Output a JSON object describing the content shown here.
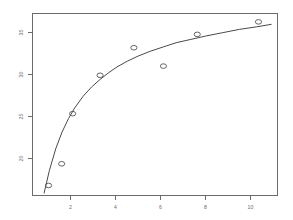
{
  "chart_data": {
    "type": "scatter",
    "title": "",
    "subtitle": "",
    "xlabel": "",
    "ylabel": "",
    "grid": false,
    "legend": "none",
    "xlim": [
      0.0,
      11.6
    ],
    "ylim": [
      15.6,
      37.4
    ],
    "xticks": [
      2,
      4,
      6,
      8,
      10
    ],
    "xticklabels": [
      "2",
      "4",
      "6",
      "8",
      "10"
    ],
    "yticks": [
      20,
      25,
      30,
      35
    ],
    "yticklabels": [
      "20",
      "25",
      "30",
      "35"
    ],
    "ytick_rotation": 90,
    "marker": "open-circle",
    "points": [
      {
        "x": 0.76,
        "y": 16.8
      },
      {
        "x": 1.38,
        "y": 19.4
      },
      {
        "x": 1.9,
        "y": 25.4
      },
      {
        "x": 3.2,
        "y": 30.0
      },
      {
        "x": 4.8,
        "y": 33.3
      },
      {
        "x": 6.2,
        "y": 31.1
      },
      {
        "x": 7.8,
        "y": 34.9
      },
      {
        "x": 10.7,
        "y": 36.4
      }
    ],
    "series": [
      {
        "name": "observed",
        "x": [
          0.76,
          1.38,
          1.9,
          3.2,
          4.8,
          6.2,
          7.8,
          10.7
        ],
        "values": [
          16.8,
          19.4,
          25.4,
          30.0,
          33.3,
          31.1,
          34.9,
          36.4
        ]
      },
      {
        "name": "fitted-curve",
        "type": "line",
        "x": [
          0.55,
          0.8,
          1.1,
          1.4,
          1.7,
          2.0,
          2.4,
          2.8,
          3.2,
          3.6,
          4.0,
          4.5,
          5.0,
          5.6,
          6.2,
          6.8,
          7.5,
          8.2,
          9.0,
          9.8,
          10.6,
          11.3
        ],
        "values": [
          15.9,
          18.6,
          21.2,
          23.2,
          24.8,
          26.1,
          27.5,
          28.6,
          29.5,
          30.3,
          31.0,
          31.7,
          32.3,
          32.9,
          33.4,
          33.9,
          34.3,
          34.7,
          35.1,
          35.5,
          35.8,
          36.1
        ]
      }
    ]
  },
  "figure": {
    "background_color": "#ffffff",
    "frame_color": "#6b6b6b",
    "curve_color": "#4a4a4a",
    "marker_color": "#555555",
    "tick_label_color": "#6b6b6b"
  }
}
